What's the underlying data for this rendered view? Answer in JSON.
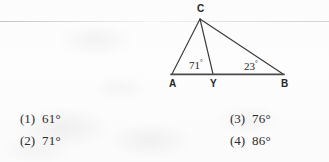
{
  "page": {
    "background_color": "#fdfdfd",
    "ink_color": "#2b2b2b"
  },
  "figure": {
    "name": "triangle-abc-with-cevian-cy",
    "vertices": [
      {
        "label": "C",
        "x": 200,
        "y": 19
      },
      {
        "label": "A",
        "x": 172,
        "y": 74
      },
      {
        "label": "Y",
        "x": 213,
        "y": 74
      },
      {
        "label": "B",
        "x": 283,
        "y": 74
      }
    ],
    "vertex_labels": {
      "c": "C",
      "a": "A",
      "y": "Y",
      "b": "B"
    },
    "angles": [
      {
        "at": "Y",
        "value": "71",
        "symbol": "°",
        "text": "71°"
      },
      {
        "at": "B",
        "value": "23",
        "symbol": "°",
        "text": "23°"
      }
    ],
    "angle_labels": {
      "angle_y": "71",
      "angle_y_symbol": "°",
      "angle_b": "23",
      "angle_b_symbol": "°"
    },
    "segments": [
      {
        "from": "A",
        "to": "C"
      },
      {
        "from": "C",
        "to": "B"
      },
      {
        "from": "C",
        "to": "Y"
      },
      {
        "from": "A",
        "to": "B"
      }
    ],
    "line_color": "#3a3a3a",
    "base_line_color": "#4a4a4a"
  },
  "options": [
    {
      "number": "(1)",
      "value": "61°"
    },
    {
      "number": "(2)",
      "value": "71°"
    },
    {
      "number": "(3)",
      "value": "76°"
    },
    {
      "number": "(4)",
      "value": "86°"
    }
  ]
}
